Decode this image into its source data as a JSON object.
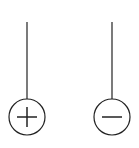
{
  "diagram": {
    "background": "#ffffff",
    "stroke_color": "#222222",
    "terminals": [
      {
        "polarity": "positive",
        "symbol": "+",
        "x": 27,
        "line_top": 22,
        "circle_cy": 117,
        "r": 18
      },
      {
        "polarity": "negative",
        "symbol": "-",
        "x": 112,
        "line_top": 22,
        "circle_cy": 117,
        "r": 18
      }
    ]
  }
}
